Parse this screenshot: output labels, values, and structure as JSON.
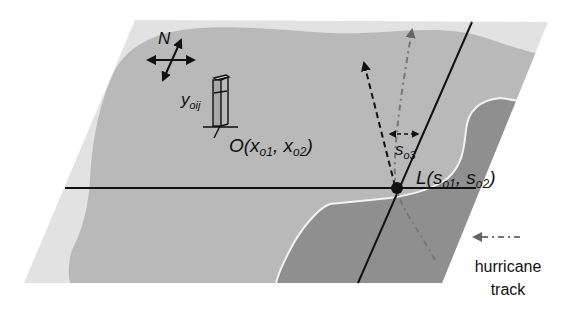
{
  "diagram": {
    "type": "hurricane-landfall-geometry",
    "colors": {
      "background": "#ffffff",
      "plane": "#e2e2e2",
      "land": "#b9b9b9",
      "land_dark": "#8f8f8f",
      "coast_line": "#f2f2f2",
      "ink": "#111111",
      "track_dash": "#777777"
    },
    "compass": {
      "label": "N"
    },
    "observation_site": {
      "value_label": {
        "base": "y",
        "sub": "oij"
      },
      "location_label": {
        "prefix": "O(",
        "x1": "x",
        "x1_sub": "o1",
        "sep": ", ",
        "x2": "x",
        "x2_sub": "o2",
        "suffix": ")"
      }
    },
    "landfall_point": {
      "label": {
        "prefix": "L(",
        "s1": "s",
        "s1_sub": "o1",
        "sep": ", ",
        "s2": "s",
        "s2_sub": "o2",
        "suffix": ")"
      }
    },
    "heading_angle": {
      "base": "s",
      "sub": "o3"
    },
    "legend": {
      "line1": "hurricane",
      "line2": "track"
    }
  }
}
